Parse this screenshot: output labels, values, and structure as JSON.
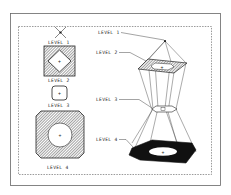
{
  "figure": {
    "left_labels": [
      "LEVEL 1",
      "LEVEL 2",
      "LEVEL 3",
      "LEVEL 4"
    ],
    "right_labels": [
      "LEVEL 1",
      "LEVEL 2",
      "LEVEL 3",
      "LEVEL 4"
    ],
    "center_mark": "+"
  }
}
